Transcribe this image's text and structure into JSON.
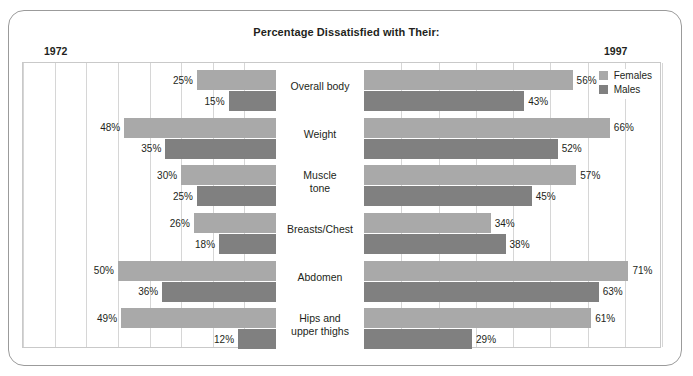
{
  "chart_title": "Percentage Dissatisfied with Their:",
  "year_left": "1972",
  "year_right": "1997",
  "legend": {
    "position": "top-right",
    "items": [
      {
        "label": "Females",
        "color": "#a9a9a9",
        "key": "females"
      },
      {
        "label": "Males",
        "color": "#808080",
        "key": "males"
      }
    ]
  },
  "chart_data": {
    "type": "bar",
    "title": "Percentage Dissatisfied with Their:",
    "subtitle": "",
    "orientation": "horizontal",
    "layout": "bidirectional back-to-back panels: left panel = 1972 (bars extend leftward), right panel = 1997 (bars extend rightward)",
    "xlabel": "",
    "ylabel": "",
    "xlim": [
      0,
      80
    ],
    "grid": true,
    "gridlines_every": 10,
    "value_suffix": "%",
    "panels": [
      "1972",
      "1997"
    ],
    "categories": [
      "Overall body",
      "Weight",
      "Muscle tone",
      "Breasts/Chest",
      "Abdomen",
      "Hips and upper thighs"
    ],
    "series": [
      {
        "name": "Females",
        "panel": "1972",
        "color": "#a9a9a9",
        "values": [
          25,
          48,
          30,
          26,
          50,
          49
        ]
      },
      {
        "name": "Males",
        "panel": "1972",
        "color": "#808080",
        "values": [
          15,
          35,
          25,
          18,
          36,
          12
        ]
      },
      {
        "name": "Females",
        "panel": "1997",
        "color": "#a9a9a9",
        "values": [
          56,
          66,
          57,
          34,
          71,
          61
        ]
      },
      {
        "name": "Males",
        "panel": "1997",
        "color": "#808080",
        "values": [
          43,
          52,
          45,
          38,
          63,
          29
        ]
      }
    ]
  },
  "rows": [
    {
      "category_line1": "Overall body",
      "category_line2": "",
      "left": {
        "females": "25%",
        "males": "15%",
        "females_value": 25,
        "males_value": 15
      },
      "right": {
        "females": "56%",
        "males": "43%",
        "females_value": 56,
        "males_value": 43
      }
    },
    {
      "category_line1": "Weight",
      "category_line2": "",
      "left": {
        "females": "48%",
        "males": "35%",
        "females_value": 48,
        "males_value": 35
      },
      "right": {
        "females": "66%",
        "males": "52%",
        "females_value": 66,
        "males_value": 52
      }
    },
    {
      "category_line1": "Muscle",
      "category_line2": "tone",
      "left": {
        "females": "30%",
        "males": "25%",
        "females_value": 30,
        "males_value": 25
      },
      "right": {
        "females": "57%",
        "males": "45%",
        "females_value": 57,
        "males_value": 45
      }
    },
    {
      "category_line1": "Breasts/Chest",
      "category_line2": "",
      "left": {
        "females": "26%",
        "males": "18%",
        "females_value": 26,
        "males_value": 18
      },
      "right": {
        "females": "34%",
        "males": "38%",
        "females_value": 34,
        "males_value": 38
      }
    },
    {
      "category_line1": "Abdomen",
      "category_line2": "",
      "left": {
        "females": "50%",
        "males": "36%",
        "females_value": 50,
        "males_value": 36
      },
      "right": {
        "females": "71%",
        "males": "63%",
        "females_value": 71,
        "males_value": 63
      }
    },
    {
      "category_line1": "Hips and",
      "category_line2": "upper thighs",
      "left": {
        "females": "49%",
        "males": "12%",
        "females_value": 49,
        "males_value": 12
      },
      "right": {
        "females": "61%",
        "males": "29%",
        "females_value": 61,
        "males_value": 29
      }
    }
  ]
}
